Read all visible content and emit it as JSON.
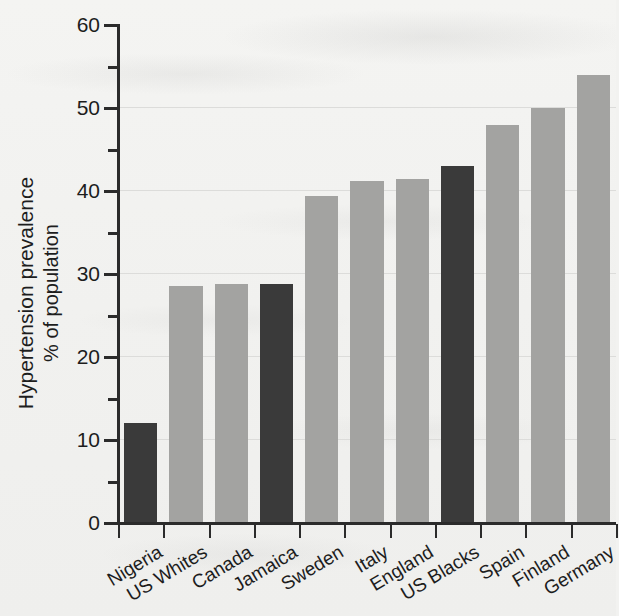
{
  "chart_data": {
    "type": "bar",
    "title": "",
    "subtitle": "",
    "xlabel": "",
    "ylabel": "Hypertension prevalence\n% of population",
    "ylabel_line1": "Hypertension prevalence",
    "ylabel_line2": "% of population",
    "ylim": [
      0,
      60
    ],
    "ytick_labels": [
      "0",
      "10",
      "20",
      "30",
      "40",
      "50",
      "60"
    ],
    "ytick_values": [
      0,
      10,
      20,
      30,
      40,
      50,
      60
    ],
    "yminor_values": [
      5,
      15,
      25,
      35,
      45,
      55
    ],
    "grid": "horizontal-major-faint",
    "legend": "none",
    "categories": [
      "Nigeria",
      "US Whites",
      "Canada",
      "Jamaica",
      "Sweden",
      "Italy",
      "England",
      "US Blacks",
      "Spain",
      "Finland",
      "Germany"
    ],
    "values": [
      12.0,
      28.5,
      28.8,
      28.8,
      39.4,
      41.2,
      41.5,
      43.0,
      48.0,
      50.0,
      54.0
    ],
    "bar_styles": [
      "dark",
      "light",
      "light",
      "dark",
      "light",
      "light",
      "light",
      "dark",
      "light",
      "light",
      "light"
    ],
    "colors": {
      "dark_bar": "#3a3a3a",
      "light_bar": "#a3a3a1",
      "axis": "#2b2b2b",
      "gridline": "#dcdcda",
      "background": "#f2f2f0",
      "text": "#1d1d1d"
    },
    "bars": [
      {
        "category": "Nigeria",
        "value": 12.0,
        "style": "dark"
      },
      {
        "category": "US Whites",
        "value": 28.5,
        "style": "light"
      },
      {
        "category": "Canada",
        "value": 28.8,
        "style": "light"
      },
      {
        "category": "Jamaica",
        "value": 28.8,
        "style": "dark"
      },
      {
        "category": "Sweden",
        "value": 39.4,
        "style": "light"
      },
      {
        "category": "Italy",
        "value": 41.2,
        "style": "light"
      },
      {
        "category": "England",
        "value": 41.5,
        "style": "light"
      },
      {
        "category": "US Blacks",
        "value": 43.0,
        "style": "dark"
      },
      {
        "category": "Spain",
        "value": 48.0,
        "style": "light"
      },
      {
        "category": "Finland",
        "value": 50.0,
        "style": "light"
      },
      {
        "category": "Germany",
        "value": 54.0,
        "style": "light"
      }
    ]
  }
}
